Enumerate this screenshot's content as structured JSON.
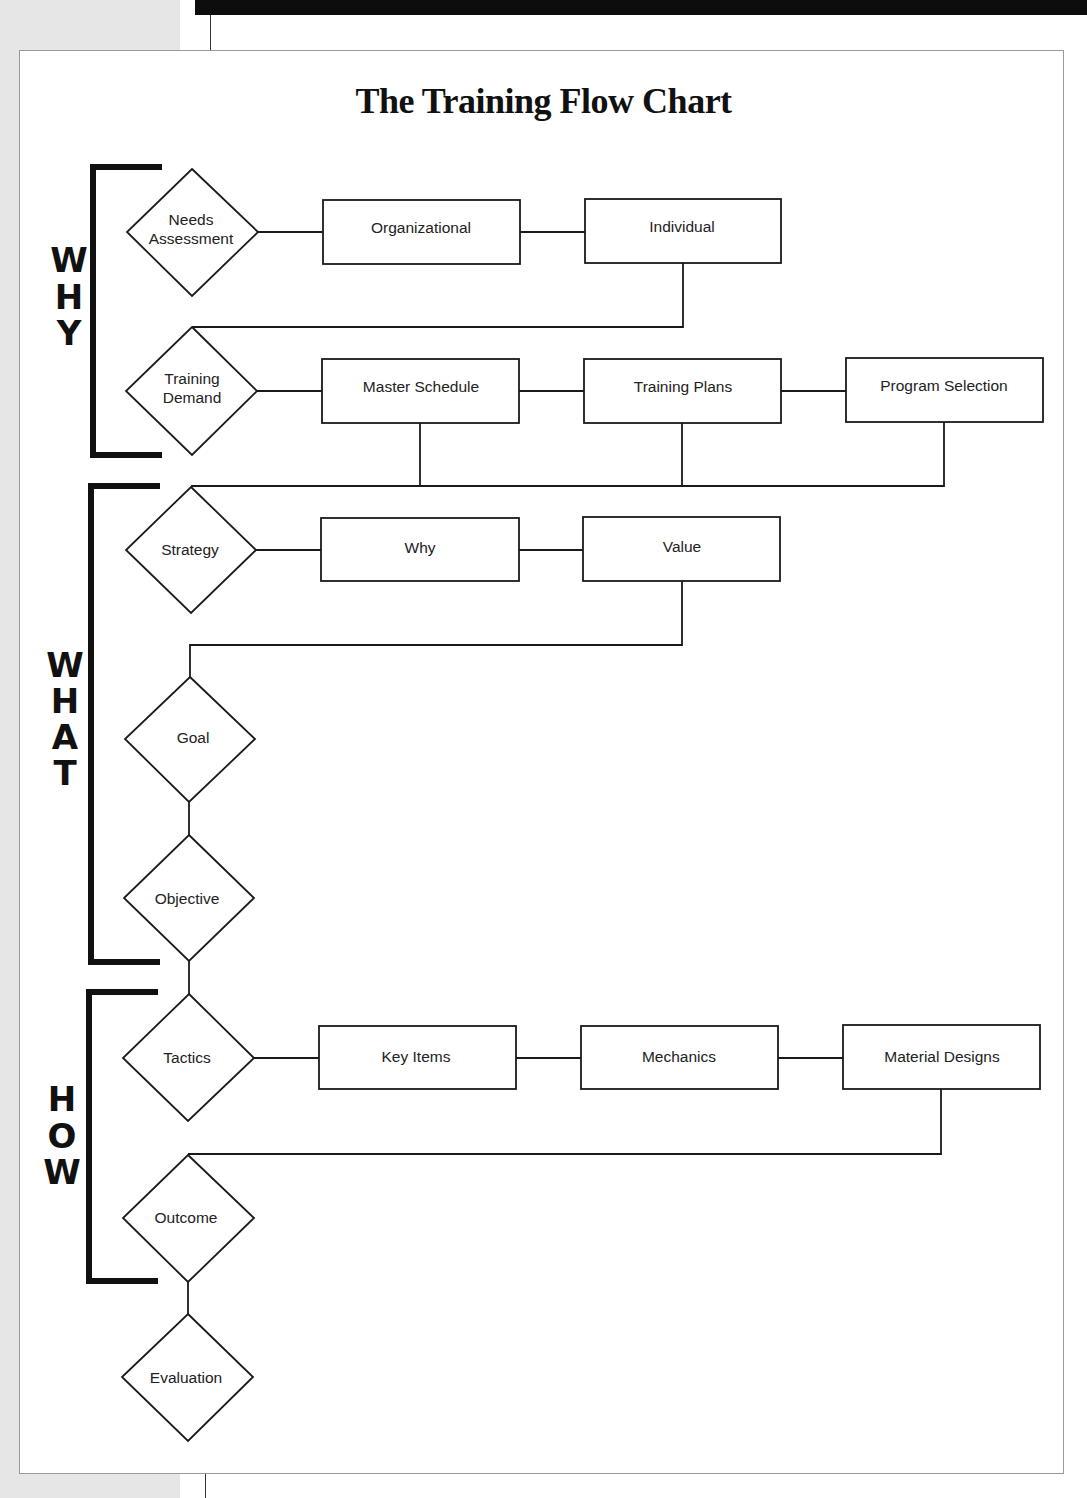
{
  "title": "The Training Flow Chart",
  "sections": [
    {
      "id": "why",
      "label": "WHY",
      "letters": [
        "W",
        "H",
        "Y"
      ]
    },
    {
      "id": "what",
      "label": "WHAT",
      "letters": [
        "W",
        "H",
        "A",
        "T"
      ]
    },
    {
      "id": "how",
      "label": "HOW",
      "letters": [
        "H",
        "O",
        "W"
      ]
    }
  ],
  "decisions": {
    "needs_assessment": {
      "line1": "Needs",
      "line2": "Assessment"
    },
    "training_demand": {
      "line1": "Training",
      "line2": "Demand"
    },
    "strategy": "Strategy",
    "goal": "Goal",
    "objective": "Objective",
    "tactics": "Tactics",
    "outcome": "Outcome",
    "evaluation": "Evaluation"
  },
  "processes": {
    "organizational": "Organizational",
    "individual": "Individual",
    "master_schedule": "Master Schedule",
    "training_plans": "Training Plans",
    "program_selection": "Program Selection",
    "why": "Why",
    "value": "Value",
    "key_items": "Key Items",
    "mechanics": "Mechanics",
    "material_designs": "Material Designs"
  },
  "colors": {
    "line": "#1a1a1a",
    "bracket": "#111111",
    "background": "#ffffff",
    "margin": "#e6e6e6"
  }
}
